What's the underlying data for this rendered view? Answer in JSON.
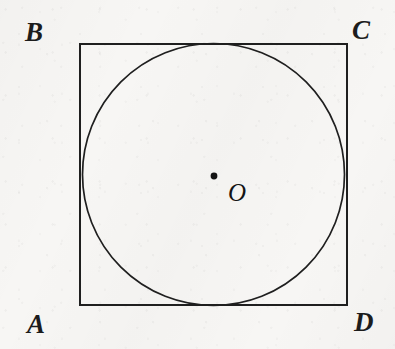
{
  "figure": {
    "kind": "geometry-diagram",
    "background_color": "#f7f6f4",
    "stroke_color": "#1f1f1f",
    "labels": {
      "top_left": "B",
      "top_right": "C",
      "bottom_left": "A",
      "bottom_right": "D",
      "center": "O"
    },
    "square": {
      "x": 80,
      "y": 44,
      "width": 267,
      "height": 261,
      "stroke_width": 2
    },
    "circle": {
      "cx": 213.5,
      "cy": 174.5,
      "r": 131,
      "stroke_width": 1.7
    },
    "center_point": {
      "cx": 214,
      "cy": 176,
      "r": 3.4
    }
  }
}
